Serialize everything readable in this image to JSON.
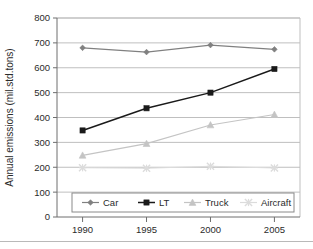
{
  "chart_data": {
    "type": "line",
    "title": "",
    "xlabel": "",
    "ylabel": "Annual emissions (mil.std.tons)",
    "categories": [
      "1990",
      "1995",
      "2000",
      "2005"
    ],
    "x": [
      1990,
      1995,
      2000,
      2005
    ],
    "xlim": [
      1988,
      2007
    ],
    "ylim": [
      0,
      800
    ],
    "ytick_labels": [
      "0",
      "100",
      "200",
      "300",
      "400",
      "500",
      "600",
      "700",
      "800"
    ],
    "ytick_values": [
      0,
      100,
      200,
      300,
      400,
      500,
      600,
      700,
      800
    ],
    "grid": true,
    "grid_axis": "y",
    "legend_position": "bottom-inside",
    "series": [
      {
        "name": "Car",
        "marker": "diamond",
        "color": "#808080",
        "values": [
          680,
          663,
          691,
          674
        ]
      },
      {
        "name": "LT",
        "marker": "square",
        "color": "#1a1a1a",
        "values": [
          348,
          437,
          500,
          595
        ]
      },
      {
        "name": "Truck",
        "marker": "triangle",
        "color": "#c4c4c4",
        "values": [
          248,
          295,
          370,
          412
        ]
      },
      {
        "name": "Aircraft",
        "marker": "cross",
        "color": "#dcdcdc",
        "values": [
          198,
          196,
          204,
          197
        ]
      }
    ]
  },
  "legend": {
    "items": [
      {
        "label": "Car"
      },
      {
        "label": "LT"
      },
      {
        "label": "Truck"
      },
      {
        "label": "Aircraft"
      }
    ]
  },
  "axes": {
    "y_title": "Annual emissions (mil.std.tons)",
    "y_ticks": [
      "800",
      "700",
      "600",
      "500",
      "400",
      "300",
      "200",
      "100",
      "0"
    ],
    "x_ticks": [
      "1990",
      "1995",
      "2000",
      "2005"
    ]
  }
}
